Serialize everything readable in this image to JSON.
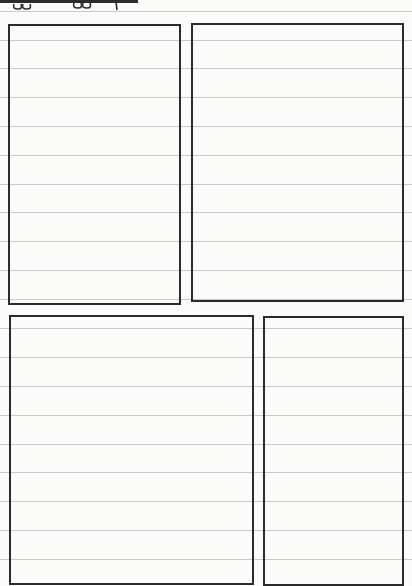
{
  "page": {
    "type": "lined comic storyboard sheet",
    "background_color": "#fbfbfa",
    "rule_color": "#c9c9c9",
    "ink_color": "#2b2b2b",
    "rule_positions_y": [
      11,
      40,
      68,
      97,
      126,
      155,
      184,
      212,
      241,
      270,
      299,
      328,
      357,
      386,
      415,
      444,
      472,
      501,
      530,
      559
    ]
  },
  "header_scribble": {
    "visible_text": "oo oo +",
    "note": "cropped handwritten marks beneath a thick line at the top-left edge"
  },
  "panels": [
    {
      "id": "panel-1",
      "x": 8,
      "y": 24,
      "width": 173,
      "height": 281,
      "content": ""
    },
    {
      "id": "panel-2",
      "x": 191,
      "y": 23,
      "width": 213,
      "height": 279,
      "content": ""
    },
    {
      "id": "panel-3",
      "x": 9,
      "y": 315,
      "width": 245,
      "height": 270,
      "content": ""
    },
    {
      "id": "panel-4",
      "x": 263,
      "y": 316,
      "width": 141,
      "height": 270,
      "content": ""
    }
  ]
}
